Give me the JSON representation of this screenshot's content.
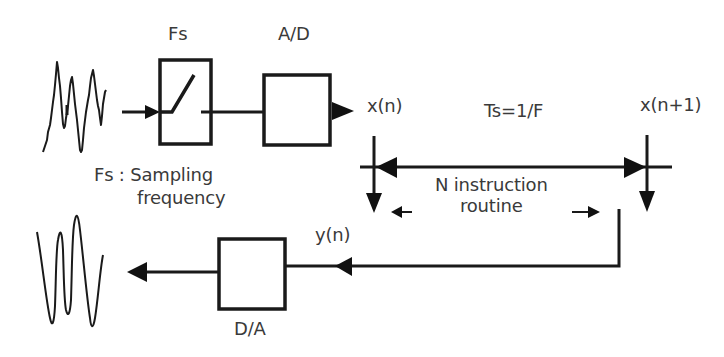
{
  "diagram": {
    "colors": {
      "line": "#1a1a1a",
      "text": "#3a3a3a",
      "background": "#ffffff"
    },
    "labels": {
      "switch_label": "Fs",
      "adc_label": "A/D",
      "fs_definition_line1": "Fs : Sampling",
      "fs_definition_line2": "frequency",
      "sample_n": "x(n)",
      "sample_n1": "x(n+1)",
      "period": "Ts=1/F",
      "routine_line1": "N instruction",
      "routine_line2": "routine",
      "output_sample": "y(n)",
      "dac_label": "D/A"
    },
    "blocks": [
      {
        "id": "sampler",
        "label": "Fs",
        "icon": "switch-icon"
      },
      {
        "id": "adc",
        "label": "A/D"
      },
      {
        "id": "dac",
        "label": "D/A"
      }
    ],
    "signals": {
      "input": "noisy-analog-signal-icon",
      "output": "smooth-analog-signal-icon"
    }
  }
}
